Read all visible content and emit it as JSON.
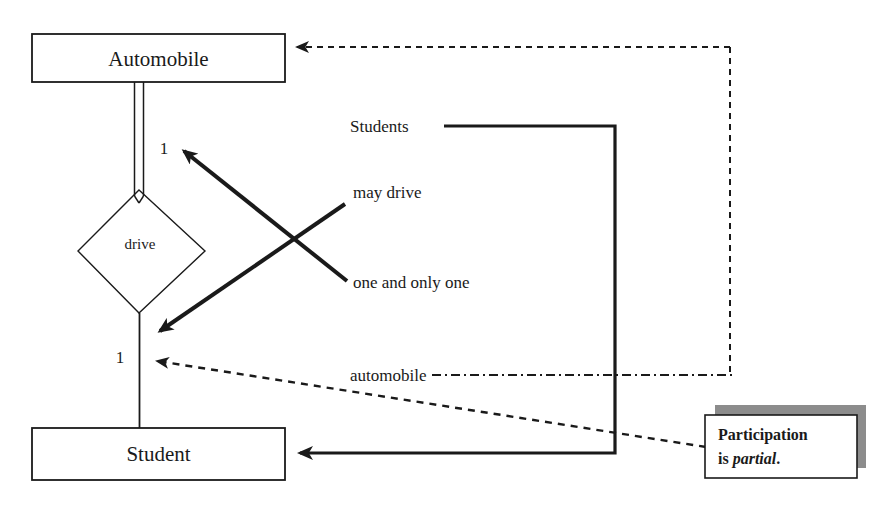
{
  "diagram": {
    "background_color": "#ffffff",
    "line_color": "#1a1a1a",
    "shadow_color": "#8c8c8c",
    "entities": [
      {
        "id": "automobile",
        "label": "Automobile",
        "shape": "rectangle"
      },
      {
        "id": "student",
        "label": "Student",
        "shape": "rectangle"
      }
    ],
    "relationship": {
      "id": "drive",
      "label": "drive",
      "shape": "diamond"
    },
    "cardinalities": [
      {
        "id": "card-upper",
        "label": "1",
        "near": "automobile-drive"
      },
      {
        "id": "card-lower",
        "label": "1",
        "near": "drive-student"
      }
    ],
    "annotations": [
      {
        "id": "students",
        "label": "Students",
        "connector": "solid"
      },
      {
        "id": "may-drive",
        "label": "may drive",
        "connector": "thick-arrow"
      },
      {
        "id": "one-and-only-one",
        "label": "one and only one",
        "connector": "thick-arrow"
      },
      {
        "id": "automobile-annot",
        "label": "automobile",
        "connector": "dash-dot"
      }
    ],
    "callout": {
      "id": "participation",
      "line1": "Participation",
      "line2_prefix": "is ",
      "line2_emphasis": "partial",
      "line2_suffix": "."
    }
  }
}
